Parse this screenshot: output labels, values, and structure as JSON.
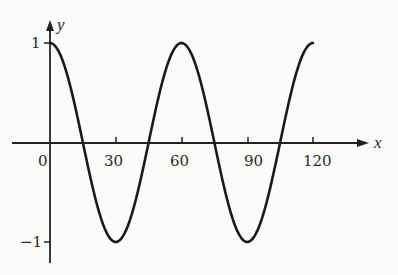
{
  "chart_data": {
    "type": "line",
    "title": "",
    "xlabel": "x",
    "ylabel": "y",
    "function": "y = cos(6x°)",
    "xlim": [
      0,
      120
    ],
    "ylim": [
      -1,
      1
    ],
    "x_ticks": [
      0,
      30,
      60,
      90,
      120
    ],
    "x_tick_labels": [
      "0",
      "30",
      "60",
      "90",
      "120"
    ],
    "y_ticks": [
      1,
      -1
    ],
    "y_tick_labels": [
      "1",
      "−1"
    ],
    "grid": false,
    "legend": null,
    "series": [
      {
        "name": "curve",
        "x": [
          0,
          15,
          30,
          45,
          60,
          75,
          90,
          105,
          120
        ],
        "values": [
          1,
          0.71,
          0,
          -0.71,
          -1,
          -0.71,
          0,
          0.71,
          1
        ]
      }
    ]
  },
  "labels": {
    "x_axis": "x",
    "y_axis": "y",
    "origin": "0",
    "x30": "30",
    "x60": "60",
    "x90": "90",
    "x120": "120",
    "y1": "1",
    "ym1": "−1"
  }
}
